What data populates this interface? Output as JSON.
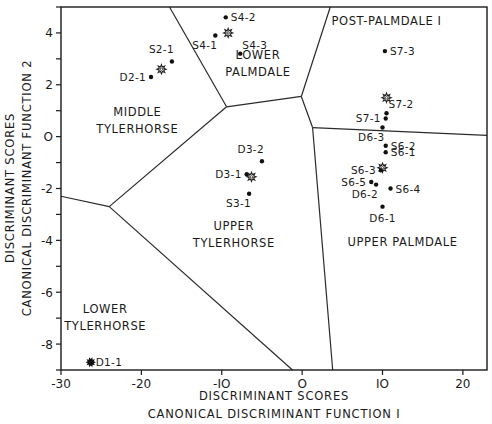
{
  "chart_data": {
    "type": "scatter",
    "title": "",
    "xlabel_line1": "DISCRIMINANT SCORES",
    "xlabel_line2": "CANONICAL DISCRIMINANT FUNCTION I",
    "ylabel_line1": "DISCRIMINANT SCORES",
    "ylabel_line2": "CANONICAL DISCRIMINANT FUNCTION 2",
    "xlim": [
      -30,
      23
    ],
    "ylim": [
      -9,
      5
    ],
    "xticks": [
      -30,
      -20,
      -10,
      0,
      10,
      20
    ],
    "xtick_labels": [
      "-30",
      "-20",
      "-IO",
      "O",
      "IO",
      "20"
    ],
    "yticks": [
      4,
      2,
      0,
      -2,
      -4,
      -6,
      -8
    ],
    "ytick_labels": [
      "4",
      "2",
      "O",
      "-2",
      "-4",
      "-6",
      "-8"
    ],
    "grid": false,
    "legend": null,
    "regions": [
      {
        "name": "MIDDLE TYLERHORSE",
        "lines": [
          "MIDDLE",
          "TYLERHORSE"
        ],
        "label_x": -20.5,
        "label_y": 0.8
      },
      {
        "name": "LOWER PALMDALE",
        "lines": [
          "LOWER",
          "PALMDALE"
        ],
        "label_x": -5.5,
        "label_y": 3.0
      },
      {
        "name": "POST-PALMDALE I",
        "lines": [
          "POST-PALMDALE I"
        ],
        "label_x": 10.5,
        "label_y": 4.3
      },
      {
        "name": "UPPER TYLERHORSE",
        "lines": [
          "UPPER",
          "TYLERHORSE"
        ],
        "label_x": -8.5,
        "label_y": -3.6
      },
      {
        "name": "UPPER PALMDALE",
        "lines": [
          "UPPER PALMDALE"
        ],
        "label_x": 12.5,
        "label_y": -4.2
      },
      {
        "name": "LOWER TYLERHORSE",
        "lines": [
          "LOWER",
          "TYLERHORSE"
        ],
        "label_x": -24.5,
        "label_y": -6.8
      }
    ],
    "boundaries": [
      {
        "x1": -16.5,
        "y1": 5.0,
        "x2": -9.4,
        "y2": 1.15
      },
      {
        "x1": -9.4,
        "y1": 1.15,
        "x2": -0.1,
        "y2": 1.55
      },
      {
        "x1": -0.1,
        "y1": 1.55,
        "x2": 3.5,
        "y2": 5.0
      },
      {
        "x1": -0.1,
        "y1": 1.55,
        "x2": 1.3,
        "y2": 0.35
      },
      {
        "x1": 1.3,
        "y1": 0.35,
        "x2": 23.0,
        "y2": 0.05
      },
      {
        "x1": 1.3,
        "y1": 0.35,
        "x2": 3.8,
        "y2": -9.0
      },
      {
        "x1": -9.4,
        "y1": 1.15,
        "x2": -24.0,
        "y2": -2.7
      },
      {
        "x1": -30.0,
        "y1": -2.3,
        "x2": -24.0,
        "y2": -2.7
      },
      {
        "x1": -24.0,
        "y1": -2.7,
        "x2": -1.2,
        "y2": -9.0
      }
    ],
    "points": [
      {
        "label": "S4-2",
        "x": -9.5,
        "y": 4.6,
        "marker": "dot",
        "label_pos": "right"
      },
      {
        "label": "S4-1",
        "x": -10.8,
        "y": 3.9,
        "marker": "dot",
        "label_pos": "below-left"
      },
      {
        "label": "",
        "x": -9.2,
        "y": 4.0,
        "marker": "star",
        "label_pos": "none"
      },
      {
        "label": "S4-3",
        "x": -7.7,
        "y": 3.2,
        "marker": "dot",
        "label_pos": "above-right"
      },
      {
        "label": "S2-1",
        "x": -16.2,
        "y": 2.9,
        "marker": "dot",
        "label_pos": "above-left"
      },
      {
        "label": "",
        "x": -17.5,
        "y": 2.6,
        "marker": "star",
        "label_pos": "none"
      },
      {
        "label": "D2-1",
        "x": -18.8,
        "y": 2.3,
        "marker": "dot",
        "label_pos": "left"
      },
      {
        "label": "S7-3",
        "x": 10.3,
        "y": 3.3,
        "marker": "dot",
        "label_pos": "right"
      },
      {
        "label": "",
        "x": 10.5,
        "y": 1.5,
        "marker": "star",
        "label_pos": "none"
      },
      {
        "label": "S7-2",
        "x": 10.5,
        "y": 0.9,
        "marker": "dot",
        "label_pos": "above-right"
      },
      {
        "label": "S7-1",
        "x": 10.4,
        "y": 0.7,
        "marker": "dot",
        "label_pos": "left"
      },
      {
        "label": "D6-3",
        "x": 10.0,
        "y": 0.35,
        "marker": "dot",
        "label_pos": "below-left"
      },
      {
        "label": "S6-2",
        "x": 10.4,
        "y": -0.35,
        "marker": "dot",
        "label_pos": "right"
      },
      {
        "label": "S6-1",
        "x": 10.4,
        "y": -0.6,
        "marker": "dot",
        "label_pos": "right"
      },
      {
        "label": "",
        "x": 10.0,
        "y": -1.2,
        "marker": "star",
        "label_pos": "none"
      },
      {
        "label": "S6-3",
        "x": 9.8,
        "y": -1.3,
        "marker": "dot",
        "label_pos": "left"
      },
      {
        "label": "S6-5",
        "x": 8.6,
        "y": -1.75,
        "marker": "dot",
        "label_pos": "left"
      },
      {
        "label": "D6-2",
        "x": 9.2,
        "y": -1.85,
        "marker": "dot",
        "label_pos": "below-left"
      },
      {
        "label": "S6-4",
        "x": 11.0,
        "y": -2.0,
        "marker": "dot",
        "label_pos": "right"
      },
      {
        "label": "D6-1",
        "x": 10.0,
        "y": -2.7,
        "marker": "dot",
        "label_pos": "below"
      },
      {
        "label": "D3-2",
        "x": -5.0,
        "y": -0.95,
        "marker": "dot",
        "label_pos": "above-left"
      },
      {
        "label": "D3-1",
        "x": -6.9,
        "y": -1.45,
        "marker": "dot",
        "label_pos": "left"
      },
      {
        "label": "",
        "x": -6.3,
        "y": -1.55,
        "marker": "star",
        "label_pos": "none"
      },
      {
        "label": "S3-1",
        "x": -6.6,
        "y": -2.2,
        "marker": "dot",
        "label_pos": "below-left"
      },
      {
        "label": "D1-1",
        "x": -26.3,
        "y": -8.7,
        "marker": "burst",
        "label_pos": "right"
      }
    ]
  }
}
